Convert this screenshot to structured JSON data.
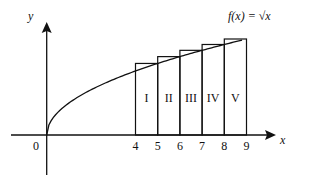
{
  "chart_data": {
    "type": "diagram",
    "title": "",
    "function_label": "f(x) = √x",
    "function": "sqrt",
    "xlabel": "x",
    "ylabel": "y",
    "origin_label": "0",
    "x_ticks": [
      "4",
      "5",
      "6",
      "7",
      "8",
      "9"
    ],
    "rectangles": [
      {
        "label": "I",
        "x0": 4,
        "x1": 5,
        "height_at": 5
      },
      {
        "label": "II",
        "x0": 5,
        "x1": 6,
        "height_at": 6
      },
      {
        "label": "III",
        "x0": 6,
        "x1": 7,
        "height_at": 7
      },
      {
        "label": "IV",
        "x0": 7,
        "x1": 8,
        "height_at": 8
      },
      {
        "label": "V",
        "x0": 8,
        "x1": 9,
        "height_at": 9
      }
    ],
    "x_range": [
      0,
      10
    ],
    "grid": false
  }
}
